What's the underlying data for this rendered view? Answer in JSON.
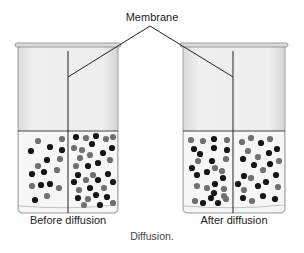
{
  "labels": {
    "membrane": "Membrane",
    "before": "Before diffusion",
    "after": "After diffusion",
    "caption": "Diffusion."
  },
  "colors": {
    "black_particle": "#161616",
    "gray_particle": "#707070",
    "beaker_glass": "#e9e9e9",
    "liquid": "#f7f7f7",
    "outline": "#555555"
  },
  "beakers": [
    {
      "name": "before",
      "x": 15,
      "width": 106,
      "rim_y": 43,
      "liquid_y": 131,
      "bottom_y": 213,
      "membrane_x": 68,
      "particles": [
        [
          38,
          141,
          "g"
        ],
        [
          62,
          139,
          "g"
        ],
        [
          31,
          151,
          "b"
        ],
        [
          50,
          147,
          "b"
        ],
        [
          62,
          150,
          "b"
        ],
        [
          47,
          160,
          "b"
        ],
        [
          60,
          159,
          "g"
        ],
        [
          38,
          166,
          "g"
        ],
        [
          57,
          170,
          "g"
        ],
        [
          32,
          174,
          "b"
        ],
        [
          44,
          172,
          "b"
        ],
        [
          32,
          186,
          "g"
        ],
        [
          41,
          185,
          "b"
        ],
        [
          50,
          184,
          "b"
        ],
        [
          59,
          188,
          "g"
        ],
        [
          35,
          200,
          "b"
        ],
        [
          47,
          196,
          "g"
        ],
        [
          76,
          137,
          "b"
        ],
        [
          86,
          138,
          "g"
        ],
        [
          96,
          136,
          "b"
        ],
        [
          106,
          139,
          "g"
        ],
        [
          113,
          137,
          "g"
        ],
        [
          74,
          148,
          "g"
        ],
        [
          82,
          150,
          "g"
        ],
        [
          92,
          144,
          "b"
        ],
        [
          112,
          148,
          "b"
        ],
        [
          80,
          158,
          "g"
        ],
        [
          90,
          155,
          "g"
        ],
        [
          103,
          153,
          "b"
        ],
        [
          88,
          166,
          "b"
        ],
        [
          98,
          163,
          "b"
        ],
        [
          110,
          160,
          "g"
        ],
        [
          76,
          166,
          "g"
        ],
        [
          78,
          175,
          "b"
        ],
        [
          93,
          175,
          "g"
        ],
        [
          108,
          174,
          "b"
        ],
        [
          74,
          182,
          "b"
        ],
        [
          86,
          180,
          "g"
        ],
        [
          98,
          180,
          "b"
        ],
        [
          113,
          182,
          "b"
        ],
        [
          79,
          190,
          "g"
        ],
        [
          90,
          188,
          "b"
        ],
        [
          104,
          188,
          "g"
        ],
        [
          78,
          198,
          "b"
        ],
        [
          88,
          199,
          "g"
        ],
        [
          96,
          195,
          "b"
        ],
        [
          107,
          197,
          "b"
        ],
        [
          113,
          203,
          "g"
        ],
        [
          84,
          205,
          "g"
        ],
        [
          100,
          205,
          "b"
        ]
      ]
    },
    {
      "name": "after",
      "x": 180,
      "width": 108,
      "rim_y": 43,
      "liquid_y": 131,
      "bottom_y": 213,
      "membrane_x": 233,
      "particles": [
        [
          191,
          140,
          "g"
        ],
        [
          203,
          141,
          "g"
        ],
        [
          214,
          139,
          "b"
        ],
        [
          227,
          140,
          "g"
        ],
        [
          194,
          149,
          "b"
        ],
        [
          214,
          148,
          "b"
        ],
        [
          227,
          150,
          "b"
        ],
        [
          200,
          154,
          "b"
        ],
        [
          198,
          161,
          "g"
        ],
        [
          212,
          161,
          "b"
        ],
        [
          226,
          159,
          "g"
        ],
        [
          192,
          168,
          "b"
        ],
        [
          197,
          175,
          "b"
        ],
        [
          207,
          172,
          "b"
        ],
        [
          215,
          168,
          "g"
        ],
        [
          222,
          171,
          "g"
        ],
        [
          223,
          178,
          "b"
        ],
        [
          215,
          184,
          "b"
        ],
        [
          197,
          186,
          "g"
        ],
        [
          207,
          188,
          "g"
        ],
        [
          224,
          189,
          "g"
        ],
        [
          214,
          193,
          "b"
        ],
        [
          224,
          196,
          "g"
        ],
        [
          195,
          201,
          "g"
        ],
        [
          203,
          203,
          "b"
        ],
        [
          211,
          198,
          "b"
        ],
        [
          218,
          203,
          "b"
        ],
        [
          226,
          199,
          "g"
        ],
        [
          242,
          142,
          "g"
        ],
        [
          251,
          138,
          "g"
        ],
        [
          261,
          143,
          "b"
        ],
        [
          270,
          139,
          "g"
        ],
        [
          248,
          151,
          "g"
        ],
        [
          258,
          157,
          "g"
        ],
        [
          269,
          153,
          "b"
        ],
        [
          277,
          149,
          "b"
        ],
        [
          243,
          159,
          "b"
        ],
        [
          254,
          165,
          "b"
        ],
        [
          263,
          170,
          "g"
        ],
        [
          270,
          164,
          "b"
        ],
        [
          279,
          161,
          "g"
        ],
        [
          251,
          178,
          "g"
        ],
        [
          244,
          176,
          "b"
        ],
        [
          266,
          182,
          "b"
        ],
        [
          276,
          175,
          "b"
        ],
        [
          238,
          184,
          "b"
        ],
        [
          244,
          190,
          "g"
        ],
        [
          258,
          186,
          "b"
        ],
        [
          278,
          187,
          "g"
        ],
        [
          243,
          198,
          "b"
        ],
        [
          252,
          201,
          "g"
        ],
        [
          263,
          196,
          "b"
        ],
        [
          275,
          199,
          "b"
        ]
      ]
    }
  ]
}
